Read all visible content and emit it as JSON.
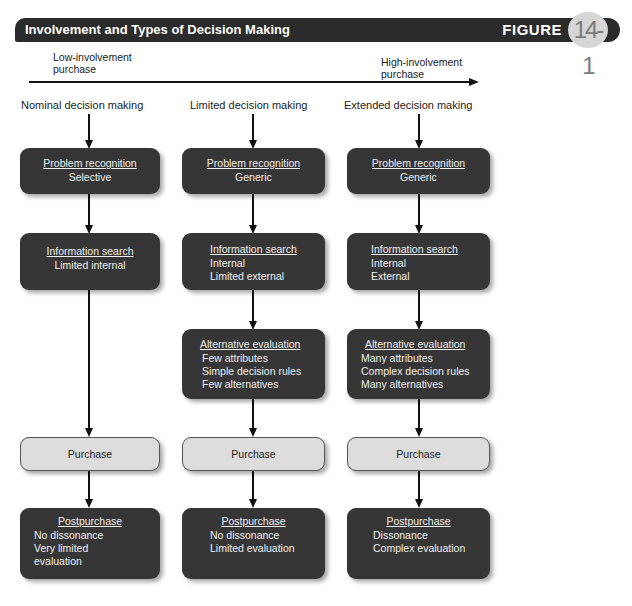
{
  "header": {
    "title": "Involvement and Types of Decision Making",
    "figure_label": "FIGURE",
    "figure_number": "14-1"
  },
  "axis": {
    "low_label_1": "Low-involvement",
    "low_label_2": "purchase",
    "high_label_1": "High-involvement",
    "high_label_2": "purchase"
  },
  "columns": [
    {
      "title": "Nominal decision making",
      "problem": {
        "title": "Problem recognition",
        "lines": [
          "Selective"
        ]
      },
      "search": {
        "title": "Information search",
        "lines": [
          "Limited internal"
        ]
      },
      "purchase": {
        "title": "Purchase"
      },
      "post": {
        "title": "Postpurchase",
        "lines": [
          "No dissonance",
          "Very limited",
          "evaluation"
        ]
      }
    },
    {
      "title": "Limited decision making",
      "problem": {
        "title": "Problem recognition",
        "lines": [
          "Generic"
        ]
      },
      "search": {
        "title": "Information search",
        "lines": [
          "Internal",
          "Limited external"
        ]
      },
      "alt": {
        "title": "Alternative evaluation",
        "lines": [
          "Few attributes",
          "Simple decision rules",
          "Few alternatives"
        ]
      },
      "purchase": {
        "title": "Purchase"
      },
      "post": {
        "title": "Postpurchase",
        "lines": [
          "No dissonance",
          "Limited evaluation"
        ]
      }
    },
    {
      "title": "Extended decision making",
      "problem": {
        "title": "Problem recognition",
        "lines": [
          "Generic"
        ]
      },
      "search": {
        "title": "Information search",
        "lines": [
          "Internal",
          "External"
        ]
      },
      "alt": {
        "title": "Alternative evaluation",
        "lines": [
          "Many attributes",
          "Complex decision rules",
          "Many alternatives"
        ]
      },
      "purchase": {
        "title": "Purchase"
      },
      "post": {
        "title": "Postpurchase",
        "lines": [
          "Dissonance",
          "Complex evaluation"
        ]
      }
    }
  ],
  "colors": {
    "dark_box": "#363636",
    "light_box": "#dcdcdc",
    "header_bar": "#2b2b2b",
    "badge": "#d6d6d6"
  }
}
